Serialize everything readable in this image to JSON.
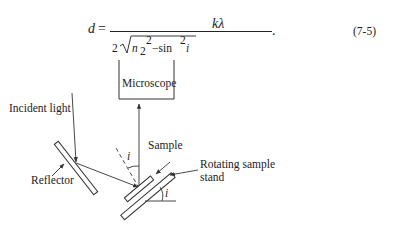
{
  "equation": {
    "lhs": "d",
    "equals": "=",
    "numerator": "kλ",
    "denominator_coef": "2",
    "denominator_radicand_prefix": "n",
    "denominator_subscript": "2",
    "denominator_superscript": "2",
    "denominator_minus": "−sin",
    "denominator_sin_exp": "2",
    "denominator_var": "i",
    "period": ".",
    "label": "(7-5)"
  },
  "diagram": {
    "labels": {
      "microscope": "Microscope",
      "incident_light": "Incident light",
      "reflector": "Reflector",
      "sample": "Sample",
      "rotating_stand_line1": "Rotating sample",
      "rotating_stand_line2": "stand",
      "angle_top": "i",
      "angle_bottom": "i"
    },
    "colors": {
      "stroke": "#333333",
      "background": "#ffffff"
    }
  }
}
